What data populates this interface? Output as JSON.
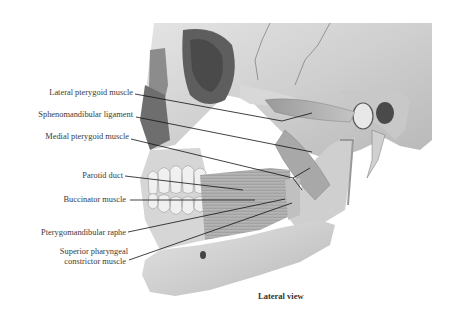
{
  "figure": {
    "title": "Lateral view",
    "labels": [
      {
        "text": "Lateral pterygoid muscle",
        "x": 0,
        "y": 88,
        "w": 133
      },
      {
        "text": "Sphenomandibular ligament",
        "x": 0,
        "y": 110,
        "w": 133
      },
      {
        "text": "Medial pterygoid muscle",
        "x": 0,
        "y": 132,
        "w": 129
      },
      {
        "text": "Parotid duct",
        "x": 0,
        "y": 172,
        "w": 123
      },
      {
        "text": "Buccinator muscle",
        "x": 0,
        "y": 195,
        "w": 126
      },
      {
        "text": "Pterygomandibular raphe",
        "x": 0,
        "y": 229,
        "w": 126
      },
      {
        "text": "Superior pharyngeal",
        "x": 0,
        "y": 248,
        "w": 128
      },
      {
        "text": "constrictor muscle",
        "x": 0,
        "y": 258,
        "w": 126
      }
    ],
    "leaders": [
      {
        "x1": 135,
        "y1": 94,
        "x2": 282,
        "y2": 121
      },
      {
        "x1": 136,
        "y1": 117,
        "x2": 312,
        "y2": 152
      },
      {
        "x1": 131,
        "y1": 139,
        "x2": 301,
        "y2": 180
      },
      {
        "x1": 125,
        "y1": 176,
        "x2": 243,
        "y2": 190
      },
      {
        "x1": 130,
        "y1": 200,
        "x2": 255,
        "y2": 200
      },
      {
        "x1": 128,
        "y1": 232,
        "x2": 285,
        "y2": 199
      },
      {
        "x1": 129,
        "y1": 260,
        "x2": 292,
        "y2": 203
      }
    ]
  }
}
